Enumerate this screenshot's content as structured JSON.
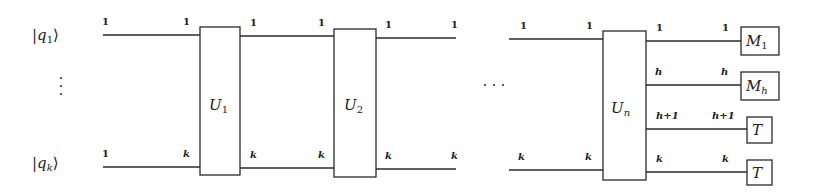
{
  "diagram": {
    "type": "quantum-circuit",
    "inputs": [
      {
        "ket": "q",
        "sub": "1"
      },
      {
        "ket": "q",
        "sub": "k"
      }
    ],
    "vertical_ellipsis": "⋮",
    "horizontal_ellipsis": "···",
    "gates": [
      {
        "name": "U",
        "sub": "1",
        "sub_italic": false
      },
      {
        "name": "U",
        "sub": "2",
        "sub_italic": false
      },
      {
        "name": "U",
        "sub": "n",
        "sub_italic": true
      }
    ],
    "segments": [
      {
        "top_start": "1",
        "top_end": "1",
        "bottom_start": "1",
        "bottom_end": "k"
      },
      {
        "top_start": "1",
        "top_end": "1",
        "bottom_start": "k",
        "bottom_end": "k"
      },
      {
        "top_start": "1",
        "top_end": "1",
        "bottom_start": "k",
        "bottom_end": "k"
      },
      {
        "top_start": "1",
        "top_end": "1",
        "bottom_start": "k",
        "bottom_end": "k"
      }
    ],
    "outputs": [
      {
        "start_label": "1",
        "end_label": "1",
        "box": "M",
        "box_sub": "1",
        "box_sub_italic": false
      },
      {
        "start_label": "h",
        "end_label": "h",
        "box": "M",
        "box_sub": "h",
        "box_sub_italic": true
      },
      {
        "start_label": "h+1",
        "end_label": "h+1",
        "box": "T",
        "box_sub": "",
        "box_sub_italic": false
      },
      {
        "start_label": "k",
        "end_label": "k",
        "box": "T",
        "box_sub": "",
        "box_sub_italic": false
      }
    ]
  }
}
